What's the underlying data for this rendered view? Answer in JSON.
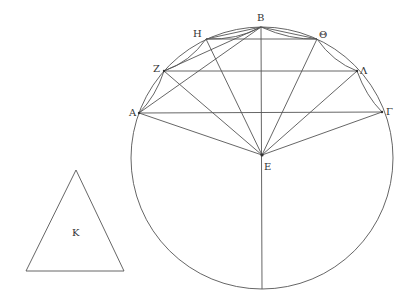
{
  "diagram": {
    "circle": {
      "cx": 262,
      "cy": 158,
      "r": 131
    },
    "points": {
      "A": {
        "label": "Α",
        "x": 139,
        "y": 113,
        "lx": 129,
        "ly": 116
      },
      "B": {
        "label": "Β",
        "x": 261,
        "y": 27,
        "lx": 257,
        "ly": 21
      },
      "G": {
        "label": "Γ",
        "x": 382,
        "y": 112,
        "lx": 386,
        "ly": 115
      },
      "E": {
        "label": "Ε",
        "x": 262,
        "y": 155,
        "lx": 264,
        "ly": 170
      },
      "Z": {
        "label": "Ζ",
        "x": 164,
        "y": 71,
        "lx": 153,
        "ly": 72
      },
      "H": {
        "label": "Η",
        "x": 206,
        "y": 39,
        "lx": 193,
        "ly": 37
      },
      "TH": {
        "label": "Θ",
        "x": 317,
        "y": 39,
        "lx": 319,
        "ly": 38
      },
      "L": {
        "label": "Λ",
        "x": 357,
        "y": 71,
        "lx": 360,
        "ly": 74
      },
      "Bottom": {
        "label": "",
        "x": 262,
        "y": 289
      }
    },
    "triangle": {
      "label": "Κ",
      "apex": [
        76,
        170
      ],
      "left": [
        26,
        271
      ],
      "right": [
        124,
        271
      ],
      "lx": 72,
      "ly": 236
    }
  }
}
